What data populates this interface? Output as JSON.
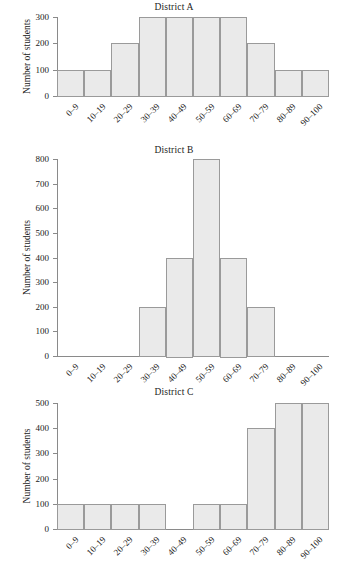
{
  "ylabel_text": "Number of students",
  "bin_labels": [
    "0–9",
    "10–19",
    "20–29",
    "30–39",
    "40–49",
    "50–59",
    "60–69",
    "70–79",
    "80–89",
    "90–100"
  ],
  "style": {
    "bar_fill": "#eaeaea",
    "bar_stroke": "#9a9a9a",
    "axis_color": "#8a8a8a",
    "text_color": "#1a1a1a",
    "background": "#ffffff"
  },
  "chart_data": [
    {
      "type": "bar",
      "title": "District A",
      "xlabel": "",
      "ylabel": "Number of students",
      "categories": [
        "0–9",
        "10–19",
        "20–29",
        "30–39",
        "40–49",
        "50–59",
        "60–69",
        "70–79",
        "80–89",
        "90–100"
      ],
      "values": [
        100,
        100,
        200,
        300,
        300,
        300,
        300,
        200,
        100,
        100
      ],
      "ylim": [
        0,
        300
      ],
      "yticks": [
        0,
        100,
        200,
        300
      ],
      "ytick_labels": [
        "0",
        "100",
        "200",
        "300"
      ],
      "grid": false,
      "legend": null
    },
    {
      "type": "bar",
      "title": "District B",
      "xlabel": "",
      "ylabel": "Number of students",
      "categories": [
        "0–9",
        "10–19",
        "20–29",
        "30–39",
        "40–49",
        "50–59",
        "60–69",
        "70–79",
        "80–89",
        "90–100"
      ],
      "values": [
        0,
        0,
        0,
        200,
        400,
        800,
        400,
        200,
        0,
        0
      ],
      "ylim": [
        0,
        800
      ],
      "yticks": [
        0,
        100,
        200,
        300,
        400,
        500,
        600,
        700,
        800
      ],
      "ytick_labels": [
        "0",
        "100",
        "200",
        "300",
        "400",
        "500",
        "600",
        "700",
        "800"
      ],
      "grid": false,
      "legend": null
    },
    {
      "type": "bar",
      "title": "District C",
      "xlabel": "",
      "ylabel": "Number of students",
      "categories": [
        "0–9",
        "10–19",
        "20–29",
        "30–39",
        "40–49",
        "50–59",
        "60–69",
        "70–79",
        "80–89",
        "90–100"
      ],
      "values": [
        100,
        100,
        100,
        100,
        0,
        100,
        100,
        400,
        500,
        500
      ],
      "ylim": [
        0,
        500
      ],
      "yticks": [
        0,
        100,
        200,
        300,
        400,
        500
      ],
      "ytick_labels": [
        "0",
        "100",
        "200",
        "300",
        "400",
        "500"
      ],
      "grid": false,
      "legend": null
    }
  ]
}
